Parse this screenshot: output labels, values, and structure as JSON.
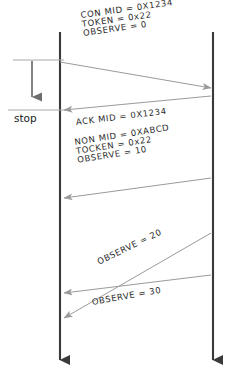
{
  "diagram": {
    "type": "sequence-diagram",
    "canvas": {
      "width": 232,
      "height": 385,
      "background": "#ffffff"
    },
    "colors": {
      "lifeline": "#3a3a3a",
      "message_arrow": "#9a9a9a",
      "stop_arrow": "#6e6e6e",
      "stop_rule": "#a8a8a8",
      "text": "#2b2b2b"
    },
    "lifelines": [
      {
        "id": "client",
        "x": 60,
        "top": 32,
        "bottom": 372,
        "has_end_arrow": true
      },
      {
        "id": "server",
        "x": 213,
        "top": 32,
        "bottom": 372,
        "has_end_arrow": true
      }
    ],
    "stop_marker": {
      "label": "stop",
      "top_rule_y": 60,
      "bottom_rule_y": 110,
      "arrow_x": 32,
      "label_x": 14,
      "label_y": 112
    },
    "messages": [
      {
        "id": "m1",
        "direction": "left-to-right",
        "from": "client",
        "to": "server",
        "x1": 60,
        "y1": 62,
        "x2": 211,
        "y2": 88,
        "lines": [
          "CON MID = 0X1234",
          "TOKEN = 0x22",
          "OBSERVE = 0"
        ],
        "label_x": 82,
        "label_y": 11,
        "rotation": -8
      },
      {
        "id": "m2",
        "direction": "right-to-left",
        "from": "server",
        "to": "client",
        "x1": 211,
        "y1": 96,
        "x2": 62,
        "y2": 110,
        "lines": [
          "ACK MID = 0X1234"
        ],
        "label_x": 76,
        "label_y": 118,
        "rotation": -7
      },
      {
        "id": "m3",
        "direction": "right-to-left",
        "from": "server",
        "to": "client",
        "x1": 211,
        "y1": 178,
        "x2": 62,
        "y2": 198,
        "lines": [
          "NON MID = 0XABCD",
          "TOCKEN = 0x22",
          "OBSERVE = 10"
        ],
        "label_x": 76,
        "label_y": 138,
        "rotation": -9
      },
      {
        "id": "m4",
        "direction": "right-to-left",
        "from": "server",
        "to": "client",
        "x1": 211,
        "y1": 233,
        "x2": 62,
        "y2": 318,
        "lines": [
          "OBSERVE = 20"
        ],
        "label_x": 98,
        "label_y": 258,
        "rotation": -26
      },
      {
        "id": "m5",
        "direction": "right-to-left",
        "from": "server",
        "to": "client",
        "x1": 211,
        "y1": 275,
        "x2": 62,
        "y2": 293,
        "lines": [
          "OBSERVE = 30",
          ""
        ],
        "label_x": 92,
        "label_y": 298,
        "rotation": -10
      }
    ]
  }
}
